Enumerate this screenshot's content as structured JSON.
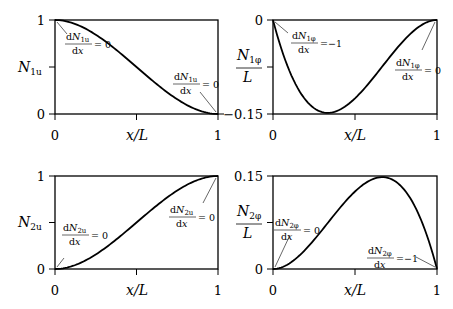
{
  "chart_data": [
    {
      "id": "N1u",
      "type": "line",
      "title": "",
      "xlabel": "x/L",
      "ylabel": "N_1u",
      "xlim": [
        0,
        1
      ],
      "ylim": [
        0,
        1
      ],
      "xticks": [
        "0",
        "1"
      ],
      "yticks": [
        "0",
        "1"
      ],
      "grid": false,
      "x": [
        0,
        0.1,
        0.2,
        0.3,
        0.4,
        0.5,
        0.6,
        0.7,
        0.8,
        0.9,
        1.0
      ],
      "values": [
        1.0,
        0.972,
        0.896,
        0.784,
        0.648,
        0.5,
        0.352,
        0.216,
        0.104,
        0.028,
        0.0
      ],
      "annotations": [
        {
          "text_num": "dN1u",
          "text_den": "dx",
          "eq": "= 0",
          "at_x": 0
        },
        {
          "text_num": "dN1u",
          "text_den": "dx",
          "eq": "= 0",
          "at_x": 1
        }
      ]
    },
    {
      "id": "N1phi",
      "type": "line",
      "xlabel": "x/L",
      "ylabel": "N_1φ / L",
      "xlim": [
        0,
        1
      ],
      "ylim": [
        -0.15,
        0
      ],
      "xticks": [
        "0",
        "1"
      ],
      "yticks": [
        "−0.15",
        "0"
      ],
      "grid": false,
      "x": [
        0,
        0.1,
        0.2,
        0.3,
        0.333,
        0.4,
        0.5,
        0.6,
        0.7,
        0.8,
        0.9,
        1.0
      ],
      "values": [
        0.0,
        -0.081,
        -0.128,
        -0.147,
        -0.148,
        -0.144,
        -0.125,
        -0.096,
        -0.063,
        -0.032,
        -0.009,
        0.0
      ],
      "annotations": [
        {
          "text_num": "dN1φ",
          "text_den": "dx",
          "eq": "= −1",
          "at_x": 0
        },
        {
          "text_num": "dN1φ",
          "text_den": "dx",
          "eq": "= 0",
          "at_x": 1
        }
      ]
    },
    {
      "id": "N2u",
      "type": "line",
      "xlabel": "x/L",
      "ylabel": "N_2u",
      "xlim": [
        0,
        1
      ],
      "ylim": [
        0,
        1
      ],
      "xticks": [
        "0",
        "1"
      ],
      "yticks": [
        "0",
        "1"
      ],
      "grid": false,
      "x": [
        0,
        0.1,
        0.2,
        0.3,
        0.4,
        0.5,
        0.6,
        0.7,
        0.8,
        0.9,
        1.0
      ],
      "values": [
        0.0,
        0.028,
        0.104,
        0.216,
        0.352,
        0.5,
        0.648,
        0.784,
        0.896,
        0.972,
        1.0
      ],
      "annotations": [
        {
          "text_num": "dN2u",
          "text_den": "dx",
          "eq": "= 0",
          "at_x": 0
        },
        {
          "text_num": "dN2u",
          "text_den": "dx",
          "eq": "= 0",
          "at_x": 1
        }
      ]
    },
    {
      "id": "N2phi",
      "type": "line",
      "xlabel": "x/L",
      "ylabel": "N_2φ / L",
      "xlim": [
        0,
        1
      ],
      "ylim": [
        0,
        0.15
      ],
      "xticks": [
        "0",
        "1"
      ],
      "yticks": [
        "0",
        "0.15"
      ],
      "grid": false,
      "x": [
        0,
        0.1,
        0.2,
        0.3,
        0.4,
        0.5,
        0.6,
        0.667,
        0.7,
        0.8,
        0.9,
        1.0
      ],
      "values": [
        0.0,
        0.009,
        0.032,
        0.063,
        0.096,
        0.125,
        0.144,
        0.148,
        0.147,
        0.128,
        0.081,
        0.0
      ],
      "annotations": [
        {
          "text_num": "dN2φ",
          "text_den": "dx",
          "eq": "= 0",
          "at_x": 0
        },
        {
          "text_num": "dN2φ",
          "text_den": "dx",
          "eq": "= −1",
          "at_x": 1
        }
      ]
    }
  ],
  "labels": {
    "xlabel": "x/L",
    "tick0": "0",
    "tick1": "1",
    "tl_ytop": "1",
    "tl_ybot": "0",
    "tr_ytop": "0",
    "tr_ybot": "−0.15",
    "bl_ytop": "1",
    "bl_ybot": "0",
    "br_ytop": "0.15",
    "br_ybot": "0",
    "N": "N",
    "L": "L",
    "d": "d",
    "dx": "dx",
    "sub_1u": "1u",
    "sub_2u": "2u",
    "sub_1phi": "1φ",
    "sub_2phi": "2φ",
    "eq0": "= 0",
    "eqm1": "=−1"
  }
}
